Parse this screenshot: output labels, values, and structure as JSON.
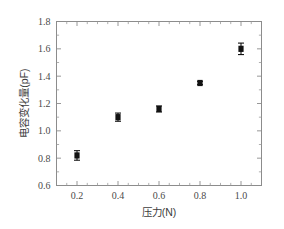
{
  "chart_data": {
    "type": "scatter",
    "title": "",
    "xlabel": "压力(N)",
    "ylabel": "电容变化量(pF)",
    "xlim": [
      0.1,
      1.1
    ],
    "ylim": [
      0.6,
      1.8
    ],
    "xticks": [
      0.2,
      0.4,
      0.6,
      0.8,
      1.0
    ],
    "xtick_labels": [
      "0.2",
      "0.4",
      "0.6",
      "0.8",
      "1.0"
    ],
    "yticks": [
      0.6,
      0.8,
      1.0,
      1.2,
      1.4,
      1.6,
      1.8
    ],
    "ytick_labels": [
      "0.6",
      "0.8",
      "1.0",
      "1.2",
      "1.4",
      "1.6",
      "1.8"
    ],
    "x_minor_ticks": [
      0.15,
      0.25,
      0.3,
      0.35,
      0.45,
      0.5,
      0.55,
      0.65,
      0.7,
      0.75,
      0.85,
      0.9,
      0.95,
      1.05
    ],
    "y_minor_ticks": [
      0.7,
      0.9,
      1.1,
      1.3,
      1.5,
      1.7
    ],
    "grid": false,
    "legend": null,
    "marker_style": "filled-square",
    "marker_color": "#121212",
    "frame_color": "#8c8c8c",
    "background": "#ffffff",
    "error_bars": true,
    "x": [
      0.2,
      0.4,
      0.6,
      0.8,
      1.0
    ],
    "values": [
      0.82,
      1.1,
      1.16,
      1.35,
      1.6
    ],
    "yerr": [
      0.035,
      0.03,
      0.022,
      0.012,
      0.042
    ],
    "series": [
      {
        "name": "电容变化量",
        "points": [
          {
            "x": 0.2,
            "y": 0.82,
            "yerr": 0.035
          },
          {
            "x": 0.4,
            "y": 1.1,
            "yerr": 0.03
          },
          {
            "x": 0.6,
            "y": 1.16,
            "yerr": 0.022
          },
          {
            "x": 0.8,
            "y": 1.35,
            "yerr": 0.012
          },
          {
            "x": 1.0,
            "y": 1.6,
            "yerr": 0.042
          }
        ]
      }
    ]
  }
}
